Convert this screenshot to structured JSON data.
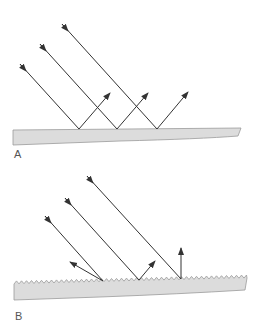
{
  "panels": [
    {
      "id": "A",
      "label": "A",
      "caption_type": "specular-reflection",
      "surface": "smooth",
      "rays": 3
    },
    {
      "id": "B",
      "label": "B",
      "caption_type": "diffuse-reflection",
      "surface": "rough",
      "rays": 3
    }
  ],
  "colors": {
    "surface_fill": "#dcdcdc",
    "surface_stroke": "#9a9a9a",
    "ray": "#333333"
  }
}
